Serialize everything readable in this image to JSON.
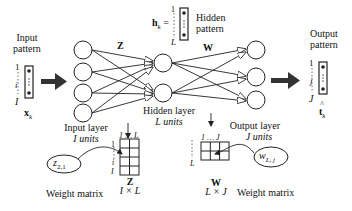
{
  "input_pattern": {
    "title_line1": "Input",
    "title_line2": "pattern",
    "index_top": "1",
    "index_mid": "i",
    "index_bottom": "I",
    "vector_label": "x",
    "vector_sub": "k"
  },
  "hidden_pattern": {
    "equation_lhs": "h",
    "equation_sub": "k",
    "equals": "=",
    "index_top": "1",
    "index_bottom": "L",
    "title_line1": "Hidden",
    "title_line2": "pattern"
  },
  "output_pattern": {
    "title_line1": "Output",
    "title_line2": "pattern",
    "index_top": "1",
    "index_mid": "j",
    "index_bottom": "J",
    "vector_label": "t",
    "vector_hat": "^",
    "vector_sub": "k"
  },
  "weights": {
    "z_label": "Z",
    "w_label": "W"
  },
  "layers": {
    "input_label_line1": "Input layer",
    "input_label_line2": "I units",
    "hidden_label_line1": "Hidden layer",
    "hidden_label_line2": "L units",
    "output_label_line1": "Output layer",
    "output_label_line2": "J units",
    "input_nodes": 4,
    "hidden_nodes": 2,
    "output_nodes": 3
  },
  "z_matrix": {
    "col_header": "1 … L",
    "row_top": "1",
    "row_mid": "i",
    "row_bottom": "I",
    "name": "Z",
    "dims": "I × L",
    "element": "z",
    "element_sub": "2,1",
    "caption": "Weight matrix"
  },
  "w_matrix": {
    "col_header": "1 … J",
    "row_bottom": "L",
    "name": "W",
    "dims": "L × J",
    "element": "w",
    "element_sub": "L, j",
    "caption": "Weight matrix"
  }
}
